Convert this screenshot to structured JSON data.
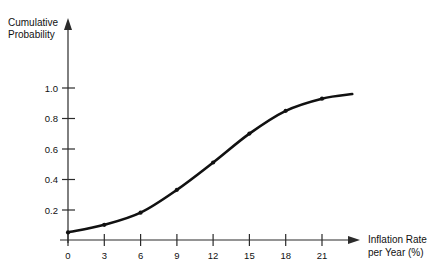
{
  "chart_data": {
    "type": "line",
    "title": "",
    "subtitle": "",
    "xlabel_line1": "Inflation Rate",
    "xlabel_line2": "per Year (%)",
    "ylabel_line1": "Cumulative",
    "ylabel_line2": "Probability",
    "xlabel": "Inflation Rate per Year (%)",
    "ylabel": "Cumulative Probability",
    "x": [
      0,
      3,
      6,
      9,
      12,
      15,
      18,
      21
    ],
    "values": [
      0.05,
      0.1,
      0.18,
      0.33,
      0.51,
      0.7,
      0.85,
      0.93
    ],
    "series": [
      {
        "name": "Cumulative Probability",
        "values": [
          0.05,
          0.1,
          0.18,
          0.33,
          0.51,
          0.7,
          0.85,
          0.93
        ]
      }
    ],
    "curve_end_point": {
      "x": 23.5,
      "y": 0.96
    },
    "xlim": [
      0,
      21
    ],
    "ylim": [
      0,
      1.05
    ],
    "x_ticks": [
      0,
      3,
      6,
      9,
      12,
      15,
      18,
      21
    ],
    "x_tick_labels": [
      "0",
      "3",
      "6",
      "9",
      "12",
      "15",
      "18",
      "21"
    ],
    "y_ticks": [
      0.2,
      0.4,
      0.6,
      0.8,
      1.0
    ],
    "y_tick_labels": [
      "0.2",
      "0.4",
      "0.6",
      "0.8",
      "1.0"
    ],
    "grid": false,
    "legend": false,
    "legend_position": "none",
    "x_axis_arrow": true,
    "y_axis_arrow": true,
    "line_color": "#111111",
    "axis_color": "#2b2b2b",
    "background_color": "#ffffff",
    "marker_style": "dot",
    "annotations": []
  }
}
